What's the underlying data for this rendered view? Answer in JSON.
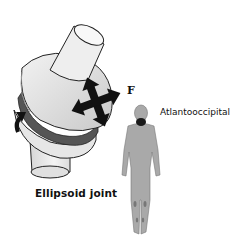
{
  "figure": {
    "joint_label": "Ellipsoid joint",
    "movement_marker": "F",
    "site_label": "Atlantooccipital"
  },
  "icons": {
    "movement_arrows": "four-way-arrow-icon",
    "rotation_arrow": "curved-arrow-icon"
  },
  "colors": {
    "background": "#ffffff",
    "bone_light": "#e8e8e8",
    "bone_shade": "#cfcfcf",
    "cartilage_band": "#555555",
    "figure_fill": "#a9a9a9",
    "highlight": "#1a1a1a",
    "outline": "#222222"
  }
}
